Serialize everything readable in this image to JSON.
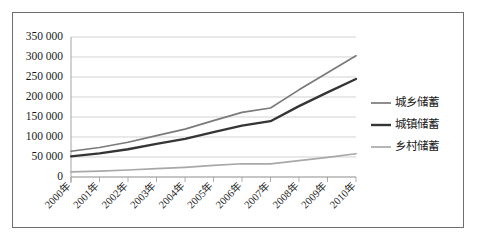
{
  "chart_data": {
    "type": "line",
    "title": "",
    "subtitle": "",
    "xlabel": "",
    "ylabel": "",
    "categories": [
      "2000年",
      "2001年",
      "2002年",
      "2003年",
      "2004年",
      "2005年",
      "2006年",
      "2007年",
      "2008年",
      "2009年",
      "2010年"
    ],
    "series": [
      {
        "name": "城乡储蓄",
        "color": "#7a7a7a",
        "values": [
          64332,
          73762,
          86911,
          103618,
          119555,
          141051,
          161587,
          172534,
          217885,
          260772,
          303302
        ]
      },
      {
        "name": "城镇储蓄",
        "color": "#353535",
        "values": [
          51434,
          59002,
          69365,
          82679,
          95326,
          112140,
          128496,
          139586,
          177180,
          211562,
          245114
        ]
      },
      {
        "name": "乡村储蓄",
        "color": "#a8a8a8",
        "values": [
          12898,
          14760,
          17546,
          20939,
          24229,
          28911,
          33091,
          32948,
          40705,
          49210,
          58188
        ]
      }
    ],
    "ylim": [
      0,
      350000
    ],
    "ytick_values": [
      0,
      50000,
      100000,
      150000,
      200000,
      250000,
      300000,
      350000
    ],
    "ytick_labels": [
      "0",
      "50 000",
      "100 000",
      "150 000",
      "200 000",
      "250 000",
      "300 000",
      "350 000"
    ],
    "grid": true,
    "legend_position": "right",
    "xtick_rotation": -45
  },
  "legend": {
    "entries": [
      {
        "label": "城乡储蓄",
        "color": "#7a7a7a",
        "width": 1.7
      },
      {
        "label": "城镇储蓄",
        "color": "#353535",
        "width": 2.4
      },
      {
        "label": "乡村储蓄",
        "color": "#a8a8a8",
        "width": 1.7
      }
    ]
  },
  "frame": {
    "border_color": "#6f6f6f",
    "background": "#ffffff"
  }
}
